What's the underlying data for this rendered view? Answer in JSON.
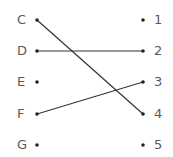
{
  "diagram": {
    "type": "matching",
    "left_items": [
      {
        "label": "C",
        "y": 20
      },
      {
        "label": "D",
        "y": 51
      },
      {
        "label": "E",
        "y": 82
      },
      {
        "label": "F",
        "y": 114
      },
      {
        "label": "G",
        "y": 145
      }
    ],
    "right_items": [
      {
        "label": "1",
        "y": 20
      },
      {
        "label": "2",
        "y": 51
      },
      {
        "label": "3",
        "y": 82
      },
      {
        "label": "4",
        "y": 114
      },
      {
        "label": "5",
        "y": 145
      }
    ],
    "connections": [
      {
        "from": "C",
        "to": "4"
      },
      {
        "from": "D",
        "to": "2"
      },
      {
        "from": "F",
        "to": "3"
      }
    ],
    "line_color": "#333333",
    "dot_color": "#222222"
  }
}
